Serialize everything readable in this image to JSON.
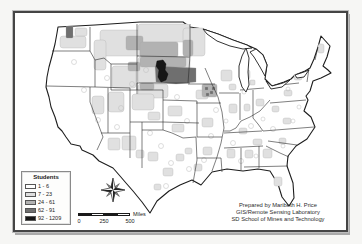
{
  "legend": {
    "title": "Students",
    "classes": [
      {
        "label": "1 - 6",
        "color": "#ffffff"
      },
      {
        "label": "7 - 23",
        "color": "#dedede"
      },
      {
        "label": "24 - 61",
        "color": "#b2b2b2"
      },
      {
        "label": "62 - 91",
        "color": "#6f6f6f"
      },
      {
        "label": "92 - 1209",
        "color": "#161616"
      }
    ]
  },
  "scale_bar": {
    "ticks": [
      "0",
      "250",
      "500"
    ],
    "unit": "Miles"
  },
  "credits": {
    "line1": "Prepared by Maribeth H. Price",
    "line2": "GIS/Remote Sensing Laboratory",
    "line3": "SD School of Mines and Technology"
  }
}
